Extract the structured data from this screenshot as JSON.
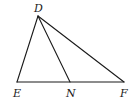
{
  "diagram": {
    "type": "geometry-triangle",
    "points": {
      "D": {
        "label": "D",
        "x": 38,
        "y": 16,
        "label_x": 34,
        "label_y": 12
      },
      "E": {
        "label": "E",
        "x": 17,
        "y": 82,
        "label_x": 13,
        "label_y": 97
      },
      "N": {
        "label": "N",
        "x": 70,
        "y": 82,
        "label_x": 66,
        "label_y": 97
      },
      "F": {
        "label": "F",
        "x": 124,
        "y": 82,
        "label_x": 120,
        "label_y": 97
      }
    },
    "segments": [
      {
        "from": "D",
        "to": "E"
      },
      {
        "from": "D",
        "to": "N"
      },
      {
        "from": "D",
        "to": "F"
      },
      {
        "from": "E",
        "to": "F"
      }
    ],
    "colors": {
      "stroke": "#1a1a1a",
      "background": "#ffffff"
    }
  }
}
